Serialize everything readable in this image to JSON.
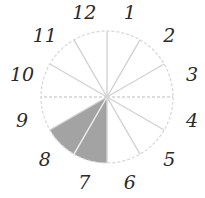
{
  "diagram": {
    "type": "clock-sector-diagram",
    "center": [
      107,
      97
    ],
    "radius": 66,
    "label_radius": 88,
    "labels": [
      "12",
      "1",
      "2",
      "3",
      "4",
      "5",
      "6",
      "7",
      "8",
      "9",
      "10",
      "11"
    ],
    "sectors_count": 12,
    "shaded_sectors": [
      {
        "from_deg": 180,
        "to_deg": 210
      },
      {
        "from_deg": 210,
        "to_deg": 240
      }
    ],
    "colors": {
      "fill": "#a3a3a3",
      "spoke": "#d2d2d2",
      "outline": "#d6d6d6",
      "label": "#2a2a2a"
    }
  }
}
